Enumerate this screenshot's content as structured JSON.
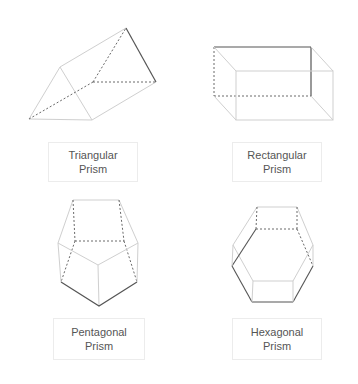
{
  "diagram": {
    "colors": {
      "light_edge": "#cfcfcf",
      "dark_edge": "#555555",
      "hidden_edge": "#6a6a6a",
      "label_text": "#555555",
      "label_border": "#ececec"
    },
    "shapes": [
      {
        "id": "triangular",
        "label_line1": "Triangular",
        "label_line2": "Prism"
      },
      {
        "id": "rectangular",
        "label_line1": "Rectangular",
        "label_line2": "Prism"
      },
      {
        "id": "pentagonal",
        "label_line1": "Pentagonal",
        "label_line2": "Prism"
      },
      {
        "id": "hexagonal",
        "label_line1": "Hexagonal",
        "label_line2": "Prism"
      }
    ]
  }
}
